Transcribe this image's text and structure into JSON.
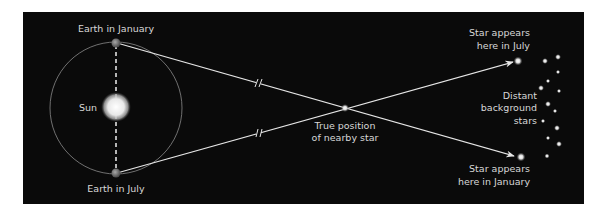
{
  "diagram": {
    "labels": {
      "earth_january": "Earth in January",
      "earth_july": "Earth in July",
      "sun": "Sun",
      "true_position_line1": "True position",
      "true_position_line2": "of nearby star",
      "star_july_line1": "Star appears",
      "star_july_line2": "here in July",
      "star_january_line1": "Star appears",
      "star_january_line2": "here in January",
      "background_line1": "Distant",
      "background_line2": "background",
      "background_line3": "stars"
    },
    "colors": {
      "panel": "#0a0a0a",
      "line": "#e6e6e6",
      "text": "#d8d8d8",
      "page": "#ffffff"
    }
  }
}
